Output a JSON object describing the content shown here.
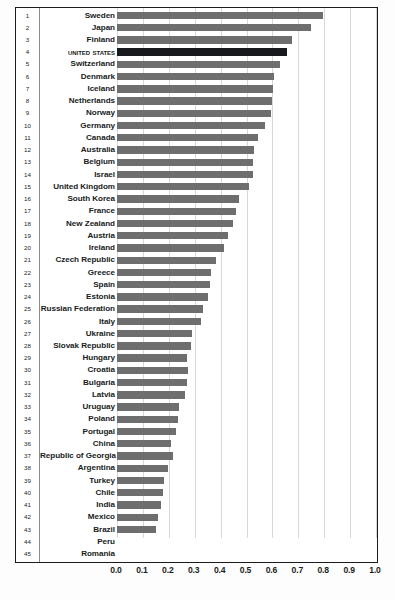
{
  "chart_data": {
    "type": "bar",
    "orientation": "horizontal",
    "title": "",
    "xlabel": "",
    "ylabel": "",
    "xlim": [
      0.0,
      1.0
    ],
    "grid": true,
    "legend": "none",
    "highlight_category": "United States",
    "highlight_color": "#17191c",
    "bar_color": "#6e6e6e",
    "xticks": [
      "0.0",
      "0.1",
      "0.2",
      "0.3",
      "0.4",
      "0.5",
      "0.6",
      "0.7",
      "0.8",
      "0.9",
      "1.0"
    ],
    "ranks": [
      1,
      2,
      3,
      4,
      5,
      6,
      7,
      8,
      9,
      10,
      11,
      12,
      13,
      14,
      15,
      16,
      17,
      18,
      19,
      20,
      21,
      22,
      23,
      24,
      25,
      26,
      27,
      28,
      29,
      30,
      31,
      32,
      33,
      34,
      35,
      36,
      37,
      38,
      39,
      40,
      41,
      42,
      43,
      44,
      45
    ],
    "categories": [
      "Sweden",
      "Japan",
      "Finland",
      "United States",
      "Switzerland",
      "Denmark",
      "Iceland",
      "Netherlands",
      "Norway",
      "Germany",
      "Canada",
      "Australia",
      "Belgium",
      "Israel",
      "United Kingdom",
      "South Korea",
      "France",
      "New Zealand",
      "Austria",
      "Ireland",
      "Czech Republic",
      "Greece",
      "Spain",
      "Estonia",
      "Russian Federation",
      "Italy",
      "Ukraine",
      "Slovak Republic",
      "Hungary",
      "Croatia",
      "Bulgaria",
      "Latvia",
      "Uruguay",
      "Poland",
      "Portugal",
      "China",
      "Republic of Georgia",
      "Argentina",
      "Turkey",
      "Chile",
      "India",
      "Mexico",
      "Brazil",
      "Peru",
      "Romania"
    ],
    "values": [
      0.795,
      0.749,
      0.677,
      0.658,
      0.628,
      0.606,
      0.604,
      0.6,
      0.596,
      0.57,
      0.543,
      0.529,
      0.526,
      0.525,
      0.511,
      0.471,
      0.46,
      0.449,
      0.427,
      0.412,
      0.381,
      0.363,
      0.358,
      0.353,
      0.333,
      0.324,
      0.289,
      0.285,
      0.27,
      0.275,
      0.271,
      0.263,
      0.238,
      0.234,
      0.229,
      0.208,
      0.217,
      0.195,
      0.183,
      0.179,
      0.17,
      0.16,
      0.149,
      0.125,
      0.122
    ]
  }
}
